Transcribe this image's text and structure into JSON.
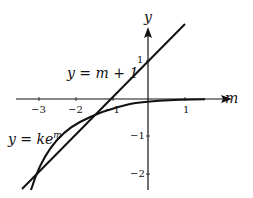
{
  "diagram": {
    "axes": {
      "x_label": "m",
      "y_label": "y",
      "x_ticks": [
        "−3",
        "−2",
        "−1",
        "1"
      ],
      "y_ticks": [
        "1",
        "−1",
        "−2"
      ]
    },
    "curves": [
      {
        "label_prefix": "y = m + 1",
        "kind": "line"
      },
      {
        "label_prefix": "y = ke",
        "label_sup": "m",
        "kind": "exponential"
      }
    ],
    "colors": {
      "stroke": "#111111",
      "background": "#ffffff"
    }
  }
}
